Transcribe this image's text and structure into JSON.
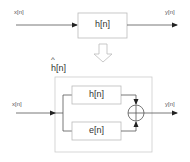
{
  "original_system": {
    "input_label": "x[n]",
    "block_label": "h[n]",
    "output_label": "y[n]"
  },
  "transform_arrow": "hollow-down-arrow",
  "estimated_system": {
    "title": "h[n]",
    "title_accent": "^",
    "input_label": "x[n]",
    "branch_top_label": "h[n]",
    "branch_bottom_label": "e[n]",
    "summer": "plus-circle",
    "output_label": "y[n]"
  },
  "colors": {
    "line": "#555555",
    "box_border": "#bbbbbb",
    "text": "#333333"
  }
}
